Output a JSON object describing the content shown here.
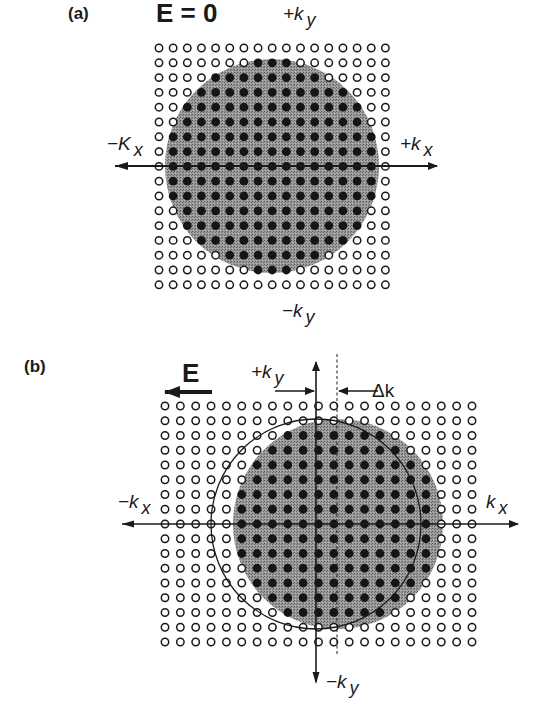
{
  "figure": {
    "panel_a": {
      "label": "(a)",
      "field_label": "E = 0",
      "axes": {
        "ky_pos": {
          "sign": "+k",
          "sub": "y"
        },
        "ky_neg": {
          "sign": "−k",
          "sub": "y"
        },
        "kx_pos": {
          "sign": "+k",
          "sub": "x"
        },
        "kx_neg": {
          "sign": "−K",
          "sub": "x"
        }
      },
      "grid": {
        "cols": 17,
        "rows": 17,
        "x0": 159,
        "y0": 48,
        "dx": 14.15,
        "dy": 14.8
      },
      "fermi_circle": {
        "cx": 272,
        "cy": 166,
        "r": 107,
        "fill": "#8a8a8a"
      }
    },
    "panel_b": {
      "label": "(b)",
      "field_label": "E",
      "shift_label": "Δk",
      "axes": {
        "ky_pos": {
          "sign": "+k",
          "sub": "y"
        },
        "ky_neg": {
          "sign": "−k",
          "sub": "y"
        },
        "kx_pos": {
          "sign": "k",
          "sub": "x"
        },
        "kx_neg": {
          "sign": "−k",
          "sub": "x"
        }
      },
      "grid": {
        "cols": 21,
        "rows": 17,
        "x0": 165,
        "y0": 406,
        "dx": 15.35,
        "dy": 14.75
      },
      "original_circle": {
        "cx": 316,
        "cy": 524,
        "r": 105
      },
      "shifted_circle": {
        "cx": 338,
        "cy": 524,
        "r": 105,
        "fill": "#8a8a8a"
      }
    },
    "colors": {
      "filled_state": "#1a1a1a",
      "empty_state": "#1a1a1a",
      "shading": "#8a8a8a",
      "background": "#ffffff"
    }
  }
}
